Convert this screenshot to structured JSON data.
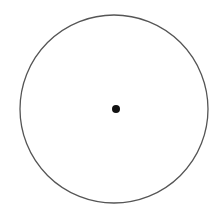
{
  "diagram": {
    "type": "circle-with-center-point",
    "background": "#ffffff",
    "circle": {
      "cx": 114,
      "cy": 109,
      "r": 94,
      "stroke": "#555555",
      "stroke_width": 1.3,
      "fill": "none"
    },
    "center_point": {
      "cx": 116,
      "cy": 109,
      "r": 4,
      "fill": "#111111"
    }
  }
}
